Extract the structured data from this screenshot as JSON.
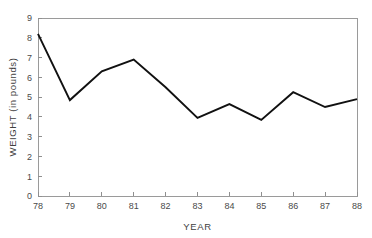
{
  "chart_data": {
    "type": "line",
    "title": "",
    "xlabel": "YEAR",
    "ylabel": "WEIGHT (in pounds)",
    "x": [
      78,
      79,
      80,
      81,
      82,
      83,
      84,
      85,
      86,
      87,
      88
    ],
    "values": [
      8.2,
      4.85,
      6.3,
      6.9,
      5.5,
      3.95,
      4.65,
      3.85,
      5.25,
      4.5,
      4.9
    ],
    "series": [
      {
        "name": "weight",
        "values": [
          8.2,
          4.85,
          6.3,
          6.9,
          5.5,
          3.95,
          4.65,
          3.85,
          5.25,
          4.5,
          4.9
        ]
      }
    ],
    "xlim": [
      78,
      88
    ],
    "ylim": [
      0,
      9
    ],
    "xticks": [
      "78",
      "79",
      "80",
      "81",
      "82",
      "83",
      "84",
      "85",
      "86",
      "87",
      "88"
    ],
    "yticks": [
      "0",
      "1",
      "2",
      "3",
      "4",
      "5",
      "6",
      "7",
      "8",
      "9"
    ],
    "grid": false,
    "legend": "none",
    "line_color": "#111111",
    "frame_color": "#9a9a9a"
  }
}
